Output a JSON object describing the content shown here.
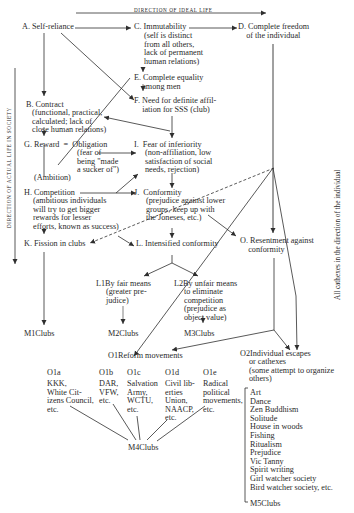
{
  "axes": {
    "top_label": "DIRECTION OF IDEAL LIFE",
    "left_label": "DIRECTION OF ACTUAL LIFE IN SOCIETY",
    "right_label": "All cathexes in the direction of the individual"
  },
  "nodes": {
    "A": {
      "label": "A. Self-reliance"
    },
    "B": {
      "label": "B. Contract",
      "detail": "(functional, practical,\ncalculated; lack of\nclose human relations)"
    },
    "C": {
      "label": "C. Immutability",
      "detail": "(self is distinct\nfrom all others,\nlack of permanent\nhuman relations)"
    },
    "D": {
      "label": "D. Complete freedom\n    of the individual"
    },
    "E": {
      "label": "E. Complete equality\n    among men"
    },
    "F": {
      "label": "F. Need for definite affil-\n    iation for SSS (club)"
    },
    "G": {
      "label": "G. Reward  =  Obligation",
      "detail": "(fear of\nbeing \"made\na sucker of\")",
      "sub": "(Ambition)"
    },
    "H": {
      "label": "H. Competition",
      "detail": "(ambitious individuals\nwill try to get bigger\nrewards for lesser\nefforts, known as success)"
    },
    "I": {
      "label": "I.  Fear of inferiority",
      "detail": "(non-affiliation, low\nsatisfaction of social\nneeds, rejection)"
    },
    "J": {
      "label": "J.  Conformity",
      "detail": "(prejudice against lower\ngroups, keep up with\nthe Joneses, etc.)"
    },
    "K": {
      "label": "K. Fission in clubs"
    },
    "L": {
      "label": "L. Intensified conformity"
    },
    "L1": {
      "label": "L1By fair means",
      "detail": "(greater pre-\njudice)"
    },
    "L2": {
      "label": "L2By unfair means",
      "detail": "to eliminate\ncompetition\n(prejudice as\nobject value)"
    },
    "O": {
      "label": "O. Resentment against\n    conformity"
    },
    "O1": {
      "label": "O1Reform movements"
    },
    "O2": {
      "label": "O2Individual escapes",
      "detail": "or cathexes\n(some attempt to organize\nothers)"
    }
  },
  "reform_groups": [
    {
      "id": "O1a",
      "text": "KKK,\nWhite Cit-\nizens Council,\netc."
    },
    {
      "id": "O1b",
      "text": "DAR,\nVFW,\netc."
    },
    {
      "id": "O1c",
      "text": "Salvation\nArmy,\nWCTU,\netc."
    },
    {
      "id": "O1d",
      "text": "Civil lib-\nerties\nUnion,\nNAACP,\netc."
    },
    {
      "id": "O1e",
      "text": "Radical\npolitical\nmovements,\netc."
    }
  ],
  "escapes": [
    "Art",
    "Dance",
    "Zen Buddhism",
    "Solitude",
    "House in woods",
    "Fishing",
    "Ritualism",
    "Prejudice",
    "Vic Tanny",
    "Spirit writing",
    "Girl watcher society",
    "Bird watcher society, etc."
  ],
  "clubs": {
    "M1": "M1Clubs",
    "M2": "M2Clubs",
    "M3": "M3Clubs",
    "M4": "M4Clubs",
    "M5": "M5Clubs"
  },
  "colors": {
    "ink": "#2a2a2a",
    "background": "#ffffff"
  }
}
